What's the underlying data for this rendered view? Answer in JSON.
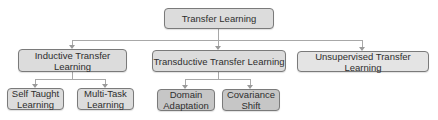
{
  "diagram": {
    "title": "Transfer Learning",
    "root": {
      "label": "Transfer Learning"
    },
    "level1": [
      {
        "label": "Inductive Transfer Learning",
        "children": [
          {
            "line1": "Self Taught",
            "line2": "Learning"
          },
          {
            "line1": "Multi-Task",
            "line2": "Learning"
          }
        ]
      },
      {
        "label": "Transductive Transfer Learning",
        "children": [
          {
            "line1": "Domain",
            "line2": "Adaptation"
          },
          {
            "line1": "Covariance",
            "line2": "Shift"
          }
        ]
      },
      {
        "label": "Unsupervised Transfer Learning",
        "children": []
      }
    ],
    "colors": {
      "box_fill": "#dcdcdc",
      "box_fill_dark": "#c6c6c6",
      "border": "#7a7a7a",
      "connector": "#a8a8a8",
      "text": "#2e2e2e"
    }
  }
}
